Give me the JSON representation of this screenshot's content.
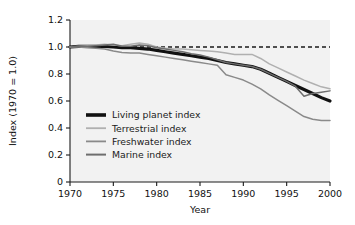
{
  "chart_data": {
    "type": "line",
    "title": "",
    "xlabel": "Year",
    "ylabel": "Index (1970 = 1.0)",
    "xlim": [
      1970,
      2000
    ],
    "ylim": [
      0,
      1.2
    ],
    "xticks": [
      "1970",
      "1975",
      "1980",
      "1985",
      "1990",
      "1995",
      "2000"
    ],
    "yticks": [
      "0",
      "0.2",
      "0.4",
      "0.6",
      "0.8",
      "1.0",
      "1.2"
    ],
    "grid": false,
    "legend_position": "lower left inside plot",
    "annotations": [
      {
        "name": "baseline-reference",
        "type": "horizontal dashed line",
        "value": 1.0,
        "style": "dashed",
        "color": "#1a1a1a"
      }
    ],
    "x": [
      1970,
      1971,
      1972,
      1973,
      1974,
      1975,
      1976,
      1977,
      1978,
      1979,
      1980,
      1981,
      1982,
      1983,
      1984,
      1985,
      1986,
      1987,
      1988,
      1989,
      1990,
      1991,
      1992,
      1993,
      1994,
      1995,
      1996,
      1997,
      1998,
      1999,
      2000
    ],
    "series": [
      {
        "name": "Living planet index",
        "color": "#111111",
        "width": 3.2,
        "values": [
          1.0,
          1.005,
          1.005,
          1.005,
          1.005,
          1.0,
          0.995,
          0.995,
          0.99,
          0.985,
          0.975,
          0.965,
          0.955,
          0.945,
          0.935,
          0.925,
          0.915,
          0.9,
          0.885,
          0.875,
          0.865,
          0.855,
          0.835,
          0.805,
          0.775,
          0.745,
          0.715,
          0.685,
          0.655,
          0.625,
          0.6
        ]
      },
      {
        "name": "Terrestrial index",
        "color": "#b0b0b0",
        "width": 1.5,
        "values": [
          1.0,
          1.005,
          1.01,
          1.015,
          1.02,
          1.015,
          1.01,
          1.02,
          1.03,
          1.02,
          1.0,
          0.99,
          0.985,
          0.985,
          0.98,
          0.975,
          0.97,
          0.965,
          0.955,
          0.945,
          0.945,
          0.945,
          0.915,
          0.875,
          0.845,
          0.815,
          0.785,
          0.755,
          0.73,
          0.705,
          0.69
        ]
      },
      {
        "name": "Freshwater index",
        "color": "#8a8a8a",
        "width": 1.5,
        "values": [
          1.0,
          1.0,
          0.995,
          0.99,
          0.985,
          0.97,
          0.96,
          0.955,
          0.955,
          0.945,
          0.935,
          0.925,
          0.915,
          0.905,
          0.895,
          0.885,
          0.875,
          0.865,
          0.795,
          0.775,
          0.755,
          0.725,
          0.69,
          0.645,
          0.605,
          0.565,
          0.525,
          0.485,
          0.465,
          0.455,
          0.455
        ]
      },
      {
        "name": "Marine index",
        "color": "#6e6e6e",
        "width": 1.5,
        "values": [
          1.0,
          1.005,
          1.005,
          1.01,
          1.015,
          1.02,
          1.005,
          1.005,
          1.015,
          1.01,
          0.995,
          0.985,
          0.975,
          0.965,
          0.95,
          0.94,
          0.925,
          0.905,
          0.885,
          0.875,
          0.865,
          0.855,
          0.835,
          0.805,
          0.775,
          0.745,
          0.71,
          0.635,
          0.655,
          0.665,
          0.675
        ]
      }
    ],
    "legend": [
      {
        "label": "Living planet index",
        "color": "#111111",
        "width": 3.6
      },
      {
        "label": "Terrestrial index",
        "color": "#b0b0b0",
        "width": 1.8
      },
      {
        "label": "Freshwater index",
        "color": "#8a8a8a",
        "width": 1.8
      },
      {
        "label": "Marine index",
        "color": "#6e6e6e",
        "width": 2.0
      }
    ]
  }
}
